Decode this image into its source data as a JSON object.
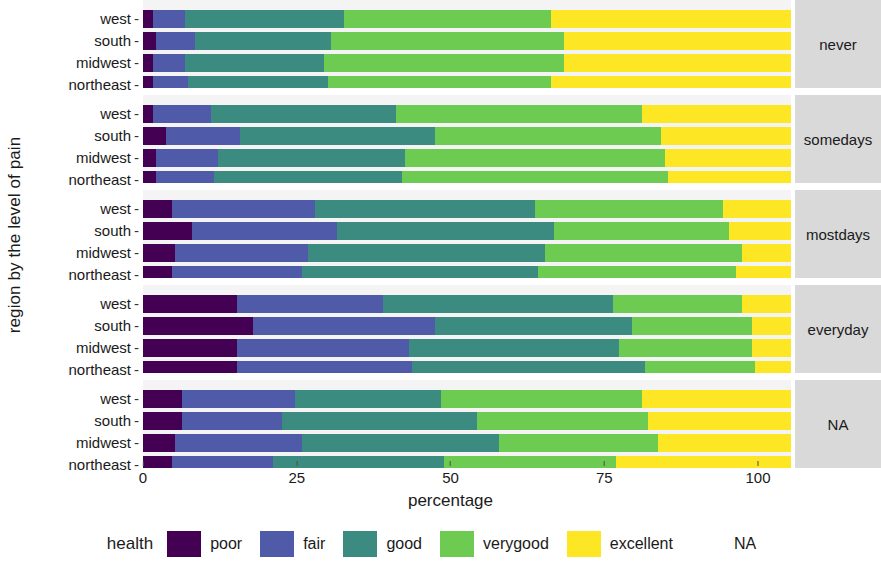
{
  "axes": {
    "y_title": "region by the level of pain",
    "x_title": "percentage",
    "x_ticks": [
      "0",
      "25",
      "50",
      "75",
      "100"
    ],
    "x_tick_values": [
      0,
      25,
      50,
      75,
      100
    ],
    "region_labels": [
      "west",
      "south",
      "midwest",
      "northeast"
    ]
  },
  "legend": {
    "title": "health",
    "items": [
      {
        "label": "poor",
        "color": "#440154"
      },
      {
        "label": "fair",
        "color": "#4f5aa8"
      },
      {
        "label": "good",
        "color": "#3b8b80"
      },
      {
        "label": "verygood",
        "color": "#6ecb52"
      },
      {
        "label": "excellent",
        "color": "#fde725"
      },
      {
        "label": "NA",
        "color": "none"
      }
    ]
  },
  "facets": [
    {
      "label": "never"
    },
    {
      "label": "somedays"
    },
    {
      "label": "mostdays"
    },
    {
      "label": "everyday"
    },
    {
      "label": "NA"
    }
  ],
  "chart_data": {
    "type": "bar",
    "subtype": "stacked-horizontal-faceted",
    "title": "",
    "xlabel": "percentage",
    "ylabel": "region by the level of pain",
    "xlim": [
      0,
      100
    ],
    "grid": false,
    "legend_position": "bottom",
    "legend_title": "health",
    "series": [
      {
        "name": "poor",
        "color": "#440154"
      },
      {
        "name": "fair",
        "color": "#4f5aa8"
      },
      {
        "name": "good",
        "color": "#3b8b80"
      },
      {
        "name": "verygood",
        "color": "#6ecb52"
      },
      {
        "name": "excellent",
        "color": "#fde725"
      }
    ],
    "facet_variable": "level of pain",
    "group_variable": "region",
    "facets": [
      {
        "facet": "never",
        "rows": [
          {
            "region": "west",
            "values": [
              1.5,
              5.0,
              24.5,
              32.0,
              37.0
            ]
          },
          {
            "region": "south",
            "values": [
              2.0,
              6.0,
              21.0,
              36.0,
              35.0
            ]
          },
          {
            "region": "midwest",
            "values": [
              1.5,
              5.0,
              21.5,
              37.0,
              35.0
            ]
          },
          {
            "region": "northeast",
            "values": [
              1.5,
              5.5,
              21.5,
              34.5,
              37.0
            ]
          }
        ]
      },
      {
        "facet": "somedays",
        "rows": [
          {
            "region": "west",
            "values": [
              1.5,
              9.0,
              28.5,
              38.0,
              23.0
            ]
          },
          {
            "region": "south",
            "values": [
              3.5,
              11.5,
              30.0,
              35.0,
              20.0
            ]
          },
          {
            "region": "midwest",
            "values": [
              2.0,
              9.5,
              29.0,
              40.0,
              19.5
            ]
          },
          {
            "region": "northeast",
            "values": [
              2.0,
              9.0,
              29.0,
              41.0,
              19.0
            ]
          }
        ]
      },
      {
        "facet": "mostdays",
        "rows": [
          {
            "region": "west",
            "values": [
              4.5,
              22.0,
              34.0,
              29.0,
              10.5
            ]
          },
          {
            "region": "south",
            "values": [
              7.5,
              22.5,
              33.5,
              27.0,
              9.5
            ]
          },
          {
            "region": "midwest",
            "values": [
              5.0,
              20.5,
              36.5,
              30.5,
              7.5
            ]
          },
          {
            "region": "northeast",
            "values": [
              4.5,
              20.0,
              36.5,
              30.5,
              8.5
            ]
          }
        ]
      },
      {
        "facet": "everyday",
        "rows": [
          {
            "region": "west",
            "values": [
              14.5,
              22.5,
              35.5,
              20.0,
              7.5
            ]
          },
          {
            "region": "south",
            "values": [
              17.0,
              28.0,
              30.5,
              18.5,
              6.0
            ]
          },
          {
            "region": "midwest",
            "values": [
              14.5,
              26.5,
              32.5,
              20.5,
              6.0
            ]
          },
          {
            "region": "northeast",
            "values": [
              14.5,
              27.0,
              36.0,
              17.0,
              5.5
            ]
          }
        ]
      },
      {
        "facet": "NA",
        "rows": [
          {
            "region": "west",
            "values": [
              6.0,
              17.5,
              22.5,
              31.0,
              23.0
            ]
          },
          {
            "region": "south",
            "values": [
              6.0,
              15.5,
              30.0,
              26.5,
              22.0
            ]
          },
          {
            "region": "midwest",
            "values": [
              5.0,
              19.5,
              30.5,
              24.5,
              20.5
            ]
          },
          {
            "region": "northeast",
            "values": [
              4.5,
              15.5,
              26.5,
              26.5,
              27.0
            ]
          }
        ]
      }
    ]
  }
}
